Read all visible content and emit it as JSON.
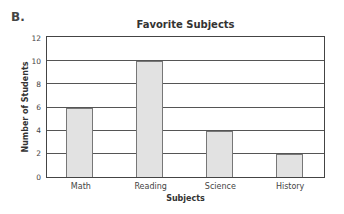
{
  "figure_label": "B.",
  "chart_data": {
    "type": "bar",
    "title": "Favorite Subjects",
    "xlabel": "Subjects",
    "ylabel": "Number of Students",
    "categories": [
      "Math",
      "Reading",
      "Science",
      "History"
    ],
    "values": [
      6,
      10,
      4,
      2
    ],
    "ylim": [
      0,
      12
    ],
    "yticks": [
      0,
      2,
      4,
      6,
      8,
      10,
      12
    ],
    "grid": true,
    "bar_color": "#e2e2e2",
    "legend": null
  }
}
